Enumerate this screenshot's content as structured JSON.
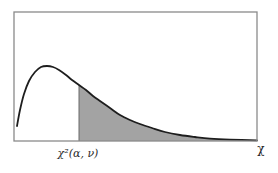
{
  "chart_data": {
    "type": "area",
    "title": "",
    "xlabel": "χ",
    "ylabel": "",
    "critical_value_label": "χ²(α, ν)",
    "grid": false,
    "legend": null,
    "frame": {
      "x0": 14,
      "y0": 12,
      "x1": 257,
      "y1": 141
    },
    "curve_points_px": [
      [
        17,
        126
      ],
      [
        20,
        110
      ],
      [
        24,
        94
      ],
      [
        29,
        81
      ],
      [
        35,
        72
      ],
      [
        41,
        67
      ],
      [
        47,
        66
      ],
      [
        53,
        67
      ],
      [
        59,
        70
      ],
      [
        66,
        75
      ],
      [
        72,
        80
      ],
      [
        79,
        85
      ],
      [
        86,
        90
      ],
      [
        93,
        96
      ],
      [
        100,
        101
      ],
      [
        110,
        108
      ],
      [
        120,
        115
      ],
      [
        130,
        120
      ],
      [
        140,
        124
      ],
      [
        152,
        128
      ],
      [
        165,
        132
      ],
      [
        180,
        135
      ],
      [
        195,
        137
      ],
      [
        210,
        138.6
      ],
      [
        230,
        139.6
      ],
      [
        257,
        140.3
      ]
    ],
    "shaded_region": {
      "from_x_px": 79,
      "to_x_px": 257,
      "meaning": "upper tail area = α"
    },
    "colors": {
      "curve": "#1e1e1e",
      "shade": "#a3a3a3",
      "frame": "#8a8a8a",
      "text": "#2a2a2a"
    }
  },
  "labels": {
    "critical_value": "χ²(α, ν)",
    "x_axis": "χ"
  }
}
